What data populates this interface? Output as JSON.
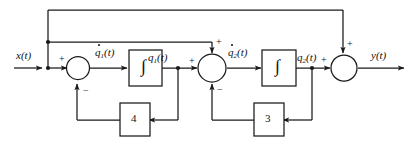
{
  "diagram": {
    "type": "control-system-block-diagram",
    "stroke_color": "#1a1a1a",
    "fill_color": "#ffffff",
    "labels": {
      "input": "x(t)",
      "output": "y(t)",
      "q1dot": "q̇₁(t)",
      "q1": "q₁(t)",
      "q2dot": "q̇₂(t)",
      "q2": "q₂(t)"
    },
    "signals": {
      "input_q": "x",
      "input_sub": "",
      "q1dot_q": "q",
      "q1dot_sub": "1",
      "q1_q": "q",
      "q1_sub": "1",
      "q2dot_q": "q",
      "q2dot_sub": "2",
      "q2_q": "q",
      "q2_sub": "2",
      "output_q": "y",
      "paren_t": "(t)"
    },
    "integrators": [
      {
        "name": "integrator-1",
        "symbol": "∫"
      },
      {
        "name": "integrator-2",
        "symbol": "∫"
      }
    ],
    "gains": [
      {
        "name": "gain-block-4",
        "value": "4"
      },
      {
        "name": "gain-block-3",
        "value": "3"
      }
    ],
    "summers": [
      {
        "name": "summing-junction-1",
        "signs": {
          "left": "+",
          "bottom": "−"
        }
      },
      {
        "name": "summing-junction-2",
        "signs": {
          "left": "+",
          "top": "+",
          "bottom": "−"
        }
      },
      {
        "name": "summing-junction-3",
        "signs": {
          "left": "+",
          "top": "+"
        }
      }
    ]
  }
}
